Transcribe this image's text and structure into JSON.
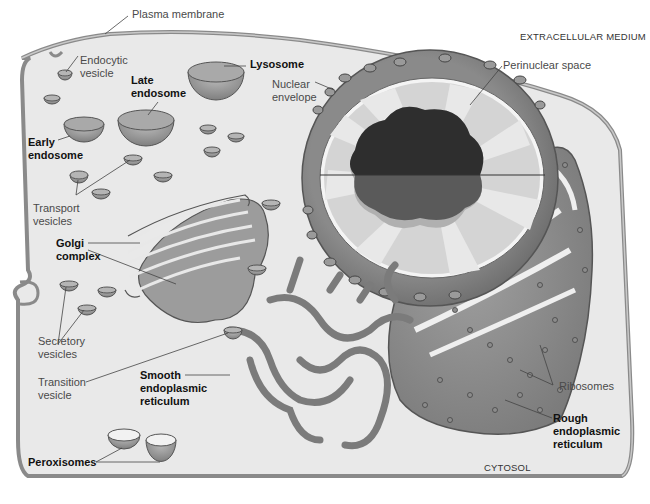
{
  "diagram": {
    "colors": {
      "cytosol": "#e9e9e9",
      "membrane": "#8a8a8a",
      "organelle_fill": "#8c8c8c",
      "organelle_dark": "#6f6f6f",
      "nucleoplasm_light": "#d4d4d4",
      "nucleolus": "#2e2e2e",
      "label_text": "#4a4a4a",
      "bold_label_text": "#111111"
    },
    "regions": {
      "extracellular": "Extracellular Medium",
      "cytosol": "Cytosol"
    },
    "labels": {
      "plasma_membrane": "Plasma membrane",
      "endocytic_vesicle": "Endocytic\nvesicle",
      "late_endosome": "Late\nendosome",
      "lysosome": "Lysosome",
      "nuclear_envelope": "Nuclear\nenvelope",
      "perinuclear_space": "Perinuclear space",
      "early_endosome": "Early\nendosome",
      "transport_vesicles": "Transport\nvesicles",
      "golgi_complex": "Golgi\ncomplex",
      "secretory_vesicles": "Secretory\nvesicles",
      "transition_vesicle": "Transition\nvesicle",
      "smooth_er": "Smooth\nendoplasmic\nreticulum",
      "ribosomes": "Ribosomes",
      "rough_er": "Rough\nendoplasmic\nreticulum",
      "peroxisomes": "Peroxisomes"
    }
  }
}
